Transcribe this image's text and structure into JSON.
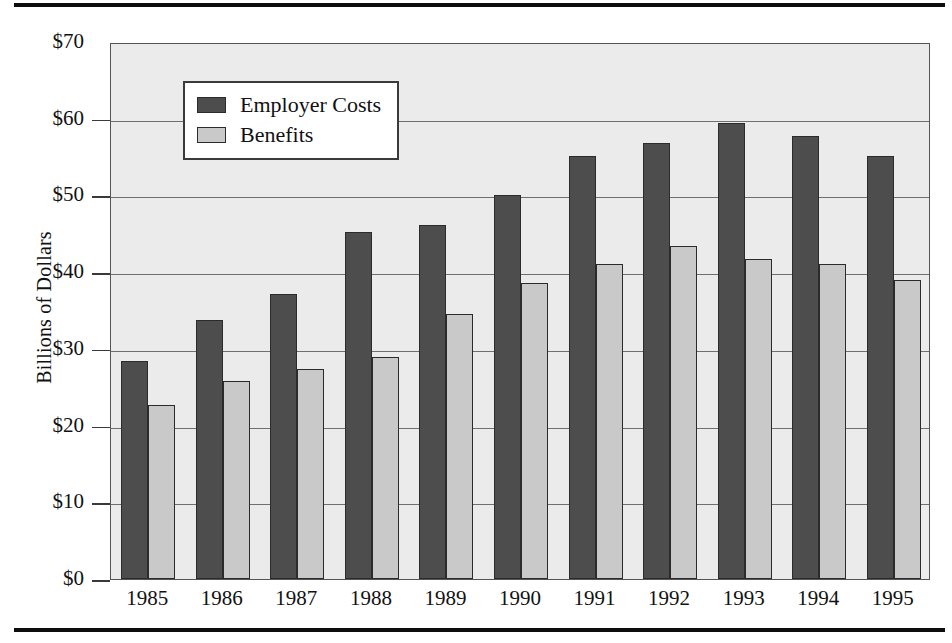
{
  "figure": {
    "y_axis_title": "Billions of Dollars",
    "plot_background": "#ebebeb",
    "page_rule_color": "#0d0d0d"
  },
  "legend": {
    "items": [
      {
        "label": "Employer Costs",
        "color": "#4d4d4d",
        "swatch_name": "legend-swatch-employer-costs"
      },
      {
        "label": "Benefits",
        "color": "#c9c9c9",
        "swatch_name": "legend-swatch-benefits"
      }
    ]
  },
  "chart_data": {
    "type": "bar",
    "title": "",
    "subtitle": "",
    "xlabel": "",
    "ylabel": "Billions of Dollars",
    "categories": [
      "1985",
      "1986",
      "1987",
      "1988",
      "1989",
      "1990",
      "1991",
      "1992",
      "1993",
      "1994",
      "1995"
    ],
    "series": [
      {
        "name": "Employer Costs",
        "color": "#4d4d4d",
        "values": [
          28.4,
          33.7,
          37.2,
          45.2,
          46.2,
          50.1,
          55.2,
          56.9,
          59.4,
          57.8,
          55.2
        ]
      },
      {
        "name": "Benefits",
        "color": "#c9c9c9",
        "values": [
          22.7,
          25.8,
          27.4,
          29.0,
          34.5,
          38.6,
          41.1,
          43.4,
          41.7,
          41.1,
          39.0
        ]
      }
    ],
    "ylim": [
      0,
      70
    ],
    "yticks": [
      0,
      10,
      20,
      30,
      40,
      50,
      60,
      70
    ],
    "ytick_labels": [
      "$0",
      "$10",
      "$20",
      "$30",
      "$40",
      "$50",
      "$60",
      "$70"
    ],
    "ytick_prefix": "$",
    "grid": true,
    "grid_axis": "y",
    "legend_position": "upper left inside"
  }
}
